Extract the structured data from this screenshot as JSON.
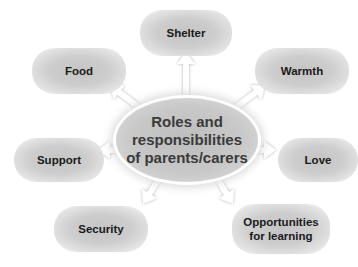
{
  "center": {
    "lines": [
      "Roles and",
      "responsibilities",
      "of parents/carers"
    ]
  },
  "nodes": [
    {
      "id": "shelter",
      "label": "Shelter"
    },
    {
      "id": "food",
      "label": "Food"
    },
    {
      "id": "warmth",
      "label": "Warmth"
    },
    {
      "id": "support",
      "label": "Support"
    },
    {
      "id": "love",
      "label": "Love"
    },
    {
      "id": "security",
      "label": "Security"
    },
    {
      "id": "opportunities",
      "lines": [
        "Opportunities",
        "for learning"
      ]
    }
  ],
  "colors": {
    "bubble": "#c8c8c8",
    "center": "#c4c4c4",
    "arrow": "#ffffff",
    "text": "#1a1a1a"
  }
}
